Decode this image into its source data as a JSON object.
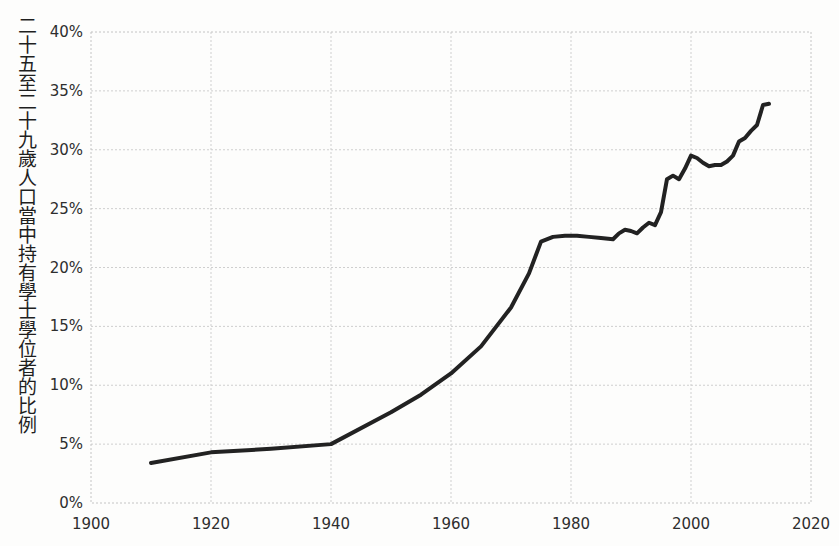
{
  "chart_data": {
    "type": "line",
    "title": "",
    "xlabel": "",
    "ylabel": "二十五至二十九歲人口當中持有學士學位者的比例",
    "xlim": [
      1900,
      2020
    ],
    "ylim": [
      0,
      40
    ],
    "grid": true,
    "legend": null,
    "line_color": "#222222",
    "line_width": 4,
    "x_ticks": [
      1900,
      1920,
      1940,
      1960,
      1980,
      2000,
      2020
    ],
    "x_tick_labels": [
      "1900",
      "1920",
      "1940",
      "1960",
      "1980",
      "2000",
      "2020"
    ],
    "y_ticks": [
      0,
      5,
      10,
      15,
      20,
      25,
      30,
      35,
      40
    ],
    "y_tick_labels": [
      "0%",
      "5%",
      "10%",
      "15%",
      "20%",
      "25%",
      "30%",
      "35%",
      "40%"
    ],
    "series": [
      {
        "name": "bachelor_degree_share",
        "x": [
          1910,
          1920,
          1930,
          1940,
          1950,
          1955,
          1960,
          1965,
          1970,
          1973,
          1975,
          1977,
          1979,
          1981,
          1983,
          1985,
          1987,
          1988,
          1989,
          1990,
          1991,
          1992,
          1993,
          1994,
          1995,
          1996,
          1997,
          1998,
          1999,
          2000,
          2001,
          2002,
          2003,
          2004,
          2005,
          2006,
          2007,
          2008,
          2009,
          2010,
          2011,
          2012,
          2013
        ],
        "values": [
          3.4,
          4.3,
          4.6,
          5.0,
          7.7,
          9.2,
          11.0,
          13.3,
          16.6,
          19.5,
          22.2,
          22.6,
          22.7,
          22.7,
          22.6,
          22.5,
          22.4,
          22.9,
          23.2,
          23.1,
          22.9,
          23.4,
          23.8,
          23.6,
          24.7,
          27.5,
          27.8,
          27.5,
          28.4,
          29.5,
          29.3,
          28.9,
          28.6,
          28.7,
          28.7,
          29.0,
          29.5,
          30.7,
          31.0,
          31.6,
          32.1,
          33.8,
          33.9
        ]
      }
    ]
  },
  "axes": {
    "plot_left_px": 91,
    "plot_right_px": 811,
    "plot_top_px": 32,
    "plot_bottom_px": 503
  }
}
